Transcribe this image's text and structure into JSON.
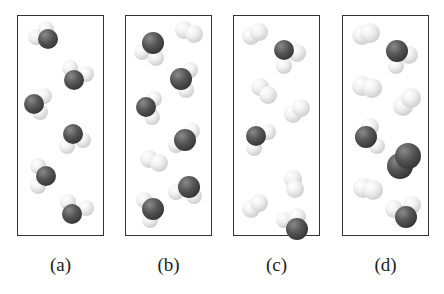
{
  "figure": {
    "panels": [
      {
        "label": "(a)",
        "contents": "6 H2O molecules"
      },
      {
        "label": "(b)",
        "contents": "5 H2O molecules and 2 H2 molecules"
      },
      {
        "label": "(c)",
        "contents": "3 H2O molecules and 4 H2 molecules"
      },
      {
        "label": "(d)",
        "contents": "2 H2O molecules, 3 H2 molecules and 1 O2 molecule"
      }
    ]
  },
  "colors": {
    "hydrogen": "#e8e8e8",
    "oxygen": "#444444",
    "border": "#333333"
  }
}
